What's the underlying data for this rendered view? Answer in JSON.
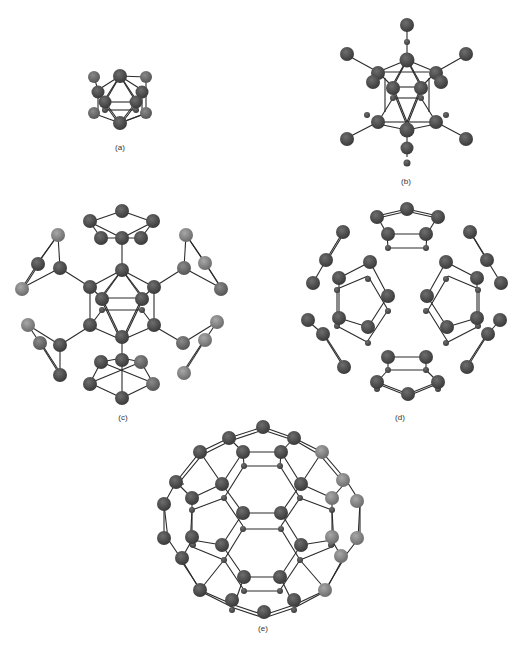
{
  "figure": {
    "panels": [
      {
        "id": "a",
        "label": "(a)",
        "description": "Icosahedron of 12 atoms"
      },
      {
        "id": "b",
        "label": "(b)",
        "description": "Icosahedron with 12 outward bonded atoms (substituted icosahedral cluster)"
      },
      {
        "id": "c",
        "label": "(c)",
        "description": "Icosahedral core with pentagonal rings attached at each vertex"
      },
      {
        "id": "d",
        "label": "(d)",
        "description": "Twelve pentagonal rings arranged icosahedrally (core removed)"
      },
      {
        "id": "e",
        "label": "(e)",
        "description": "Truncated icosahedron (C60 fullerene cage)"
      }
    ]
  },
  "colors": {
    "background": "#ffffff",
    "atom_dark": "#4a4a4a",
    "atom_mid": "#6a6a6a",
    "atom_light": "#8a8a8a",
    "bond": "#2a2a2a",
    "label": "#333333"
  }
}
